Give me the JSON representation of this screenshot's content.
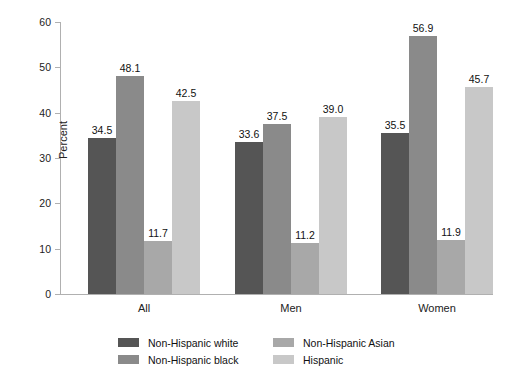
{
  "chart_data": {
    "type": "bar",
    "title": "",
    "xlabel": "",
    "ylabel": "Percent",
    "ylim": [
      0,
      60
    ],
    "yticks": [
      0,
      10,
      20,
      30,
      40,
      50,
      60
    ],
    "ytick_labels": [
      "0",
      "10",
      "20",
      "30",
      "40",
      "50",
      "60"
    ],
    "grid": false,
    "legend_position": "bottom",
    "categories": [
      "All",
      "Men",
      "Women"
    ],
    "series": [
      {
        "name": "Non-Hispanic white",
        "color": "#555555",
        "values": [
          34.5,
          33.6,
          35.5
        ],
        "labels": [
          "34.5",
          "33.6",
          "35.5"
        ]
      },
      {
        "name": "Non-Hispanic black",
        "color": "#8a8a8a",
        "values": [
          48.1,
          37.5,
          56.9
        ],
        "labels": [
          "48.1",
          "37.5",
          "56.9"
        ]
      },
      {
        "name": "Non-Hispanic Asian",
        "color": "#a8a8a8",
        "values": [
          11.7,
          11.2,
          11.9
        ],
        "labels": [
          "11.7",
          "11.2",
          "11.9"
        ]
      },
      {
        "name": "Hispanic",
        "color": "#c8c8c8",
        "values": [
          42.5,
          39.0,
          45.7
        ],
        "labels": [
          "42.5",
          "39.0",
          "45.7"
        ]
      }
    ]
  },
  "axis": {
    "ylabel": "Percent",
    "ticks": [
      "60",
      "50",
      "40",
      "30",
      "20",
      "10",
      "0"
    ]
  },
  "categories": {
    "c0": "All",
    "c1": "Men",
    "c2": "Women"
  },
  "legend": {
    "items": [
      {
        "label": "Non-Hispanic white",
        "color": "#555555"
      },
      {
        "label": "Non-Hispanic black",
        "color": "#8a8a8a"
      },
      {
        "label": "Non-Hispanic Asian",
        "color": "#a8a8a8"
      },
      {
        "label": "Hispanic",
        "color": "#c8c8c8"
      }
    ]
  }
}
